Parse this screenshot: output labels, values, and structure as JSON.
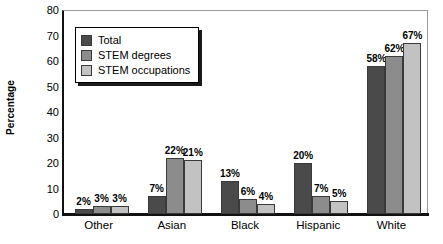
{
  "chart_data": {
    "type": "bar",
    "title": "",
    "xlabel": "",
    "ylabel": "Percentage",
    "ylim": [
      0,
      80
    ],
    "yticks": [
      0,
      10,
      20,
      30,
      40,
      50,
      60,
      70,
      80
    ],
    "grid": false,
    "legend_position": "top-left",
    "categories": [
      "Other",
      "Asian",
      "Black",
      "Hispanic",
      "White"
    ],
    "series": [
      {
        "name": "Total",
        "color": "#4a4a4a",
        "values": [
          2,
          7,
          13,
          20,
          58
        ],
        "labels": [
          "2%",
          "7%",
          "13%",
          "20%",
          "58%"
        ]
      },
      {
        "name": "STEM degrees",
        "color": "#8c8c8c",
        "values": [
          3,
          22,
          6,
          7,
          62
        ],
        "labels": [
          "3%",
          "22%",
          "6%",
          "7%",
          "62%"
        ]
      },
      {
        "name": "STEM occupations",
        "color": "#c2c2c2",
        "values": [
          3,
          21,
          4,
          5,
          67
        ],
        "labels": [
          "3%",
          "21%",
          "4%",
          "5%",
          "67%"
        ]
      }
    ],
    "axis_color": "#111111",
    "text_color": "#000000"
  }
}
